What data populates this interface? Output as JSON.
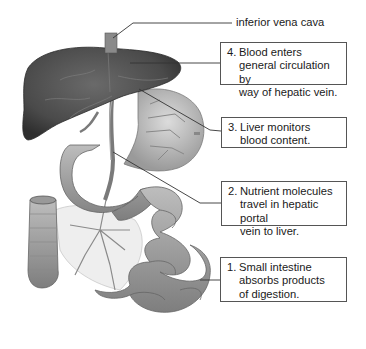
{
  "diagram": {
    "labels": {
      "ivc": "inferior vena cava"
    },
    "steps": [
      {
        "num": "1.",
        "text": "Small intestine\nabsorbs products\nof digestion."
      },
      {
        "num": "2.",
        "text": "Nutrient molecules\ntravel in hepatic portal\nvein to liver."
      },
      {
        "num": "3.",
        "text": "Liver monitors\nblood content."
      },
      {
        "num": "4.",
        "text": "Blood enters\ngeneral circulation by\nway of hepatic vein."
      }
    ],
    "colors": {
      "liver": "#4a4a4a",
      "organ": "#a8a8a8",
      "vessel": "#7a7a7a",
      "line": "#333333",
      "box_border": "#555555"
    }
  }
}
